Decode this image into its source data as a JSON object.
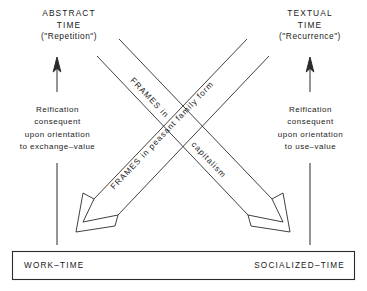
{
  "figure": {
    "title_alt": "Abstract time and textual time diagram",
    "ink_color": "#1a1a1a",
    "background": "#ffffff"
  },
  "poles": {
    "left": {
      "line1": "ABSTRACT",
      "line2": "TIME",
      "line3": "(\"Repetition\")"
    },
    "right": {
      "line1": "TEXTUAL",
      "line2": "TIME",
      "line3": "(\"Recurrence\")"
    }
  },
  "reification": {
    "left": {
      "line1": "Reification",
      "line2": "consequent",
      "line3": "upon orientation",
      "line4": "to exchange–value"
    },
    "right": {
      "line1": "Reification",
      "line2": "consequent",
      "line3": "upon orientation",
      "line4": "to use–value"
    }
  },
  "diagonal_labels": {
    "descending_upper": "FRAMES in",
    "descending_lower": "capitalism",
    "ascending": "FRAMES in peasant family form"
  },
  "bottom_box": {
    "left_label": "WORK–TIME",
    "right_label": "SOCIALIZED–TIME"
  }
}
